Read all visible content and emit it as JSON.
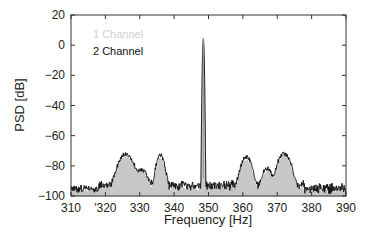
{
  "chart_data": {
    "type": "line",
    "title": "",
    "xlabel": "Frequency [Hz]",
    "ylabel": "PSD [dB]",
    "xlim": [
      310,
      390
    ],
    "ylim": [
      -100,
      20
    ],
    "xticks": [
      310,
      320,
      330,
      340,
      350,
      360,
      370,
      380,
      390
    ],
    "xtick_labels": [
      "310",
      "'320",
      "330",
      "340",
      "350",
      "360",
      "370",
      "380",
      "390"
    ],
    "yticks": [
      -100,
      -80,
      -60,
      -40,
      -20,
      0,
      20
    ],
    "ytick_labels": [
      "−100",
      "−80",
      "−60",
      "−40",
      "−20",
      "0",
      "20"
    ],
    "grid": false,
    "legend": {
      "placement": "top-left",
      "entries": [
        "1 Channel",
        "2 Channel"
      ]
    },
    "series": [
      {
        "name": "1 Channel",
        "color": "#c8c8c8",
        "style": "filled-area",
        "peaks": [
          {
            "x": 326,
            "y": -74,
            "width": 1.8
          },
          {
            "x": 330.5,
            "y": -85,
            "width": 1.5
          },
          {
            "x": 336,
            "y": -76,
            "width": 1.0
          },
          {
            "x": 348.5,
            "y": 5,
            "width": 0.15
          },
          {
            "x": 361,
            "y": -77,
            "width": 1.3
          },
          {
            "x": 367,
            "y": -84,
            "width": 1.2
          },
          {
            "x": 372,
            "y": -74,
            "width": 1.6
          }
        ],
        "noise_floor": -97
      },
      {
        "name": "2 Channel",
        "color": "#111111",
        "style": "line",
        "peaks": [
          {
            "x": 326,
            "y": -72,
            "width": 1.8
          },
          {
            "x": 330.5,
            "y": -83,
            "width": 1.5
          },
          {
            "x": 336,
            "y": -73,
            "width": 1.0
          },
          {
            "x": 348.5,
            "y": 5,
            "width": 0.15
          },
          {
            "x": 361,
            "y": -74,
            "width": 1.3
          },
          {
            "x": 367,
            "y": -82,
            "width": 1.2
          },
          {
            "x": 372,
            "y": -72,
            "width": 1.6
          }
        ],
        "noise_floor": -95
      }
    ]
  }
}
